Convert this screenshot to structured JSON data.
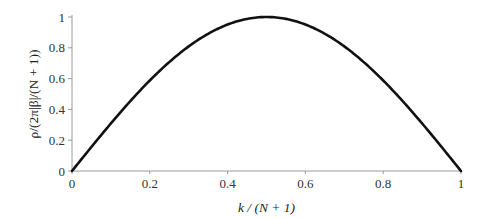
{
  "chart_data": {
    "type": "line",
    "title": "",
    "xlabel": "k / (N + 1)",
    "ylabel": "ρ/(2π|β|/(N + 1))",
    "xlim": [
      0,
      1
    ],
    "ylim": [
      0,
      1
    ],
    "xticks": [
      0,
      0.2,
      0.4,
      0.6,
      0.8,
      1
    ],
    "xtick_labels": [
      "0",
      "0.2",
      "0.4",
      "0.6",
      "0.8",
      "1"
    ],
    "yticks": [
      0,
      0.2,
      0.4,
      0.6,
      0.8,
      1
    ],
    "ytick_labels": [
      "0",
      "0.2",
      "0.4",
      "0.6",
      "0.8",
      "1"
    ],
    "grid": false,
    "legend": null,
    "series": [
      {
        "name": "sin(π k/(N+1))",
        "color": "#111111",
        "x": [
          0,
          0.05,
          0.1,
          0.15,
          0.2,
          0.25,
          0.3,
          0.35,
          0.4,
          0.45,
          0.5,
          0.55,
          0.6,
          0.65,
          0.7,
          0.75,
          0.8,
          0.85,
          0.9,
          0.95,
          1
        ],
        "y": [
          0,
          0.156,
          0.309,
          0.454,
          0.588,
          0.707,
          0.809,
          0.891,
          0.951,
          0.988,
          1,
          0.988,
          0.951,
          0.891,
          0.809,
          0.707,
          0.588,
          0.454,
          0.309,
          0.156,
          0
        ]
      }
    ]
  }
}
